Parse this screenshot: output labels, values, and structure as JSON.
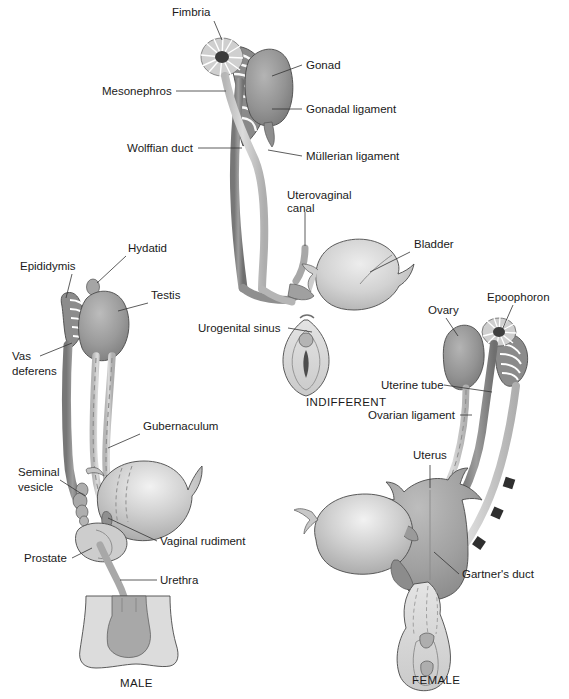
{
  "figure": {
    "background_color": "#ffffff",
    "width": 569,
    "height": 699
  },
  "palette": {
    "gonad_dark": "#8d8d8d",
    "gonad_mid": "#9a9a9a",
    "duct_gray": "#8a8a8a",
    "duct_light": "#c9c9c9",
    "organ_light": "#d3d3d3",
    "organ_pale": "#dedede",
    "uterus_gray": "#a5a5a5",
    "outline": "#4a4a4a",
    "text": "#1a1a1a",
    "leader": "#333333"
  },
  "panels": [
    {
      "id": "indifferent",
      "caption": "INDIFFERENT",
      "caption_pos": {
        "x": 306,
        "y": 406
      },
      "labels": [
        {
          "name": "fimbria",
          "text": "Fimbria",
          "x": 172,
          "y": 16,
          "anchor": "start",
          "leader": [
            [
              214,
              21
            ],
            [
              222,
              40
            ]
          ]
        },
        {
          "name": "gonad",
          "text": "Gonad",
          "x": 306,
          "y": 69,
          "anchor": "start",
          "leader": [
            [
              302,
              65
            ],
            [
              272,
              76
            ]
          ]
        },
        {
          "name": "mesonephros",
          "text": "Mesonephros",
          "x": 102,
          "y": 95,
          "anchor": "start",
          "leader": [
            [
              176,
              91
            ],
            [
              226,
              91
            ]
          ]
        },
        {
          "name": "gonadal-ligament",
          "text": "Gonadal ligament",
          "x": 306,
          "y": 113,
          "anchor": "start",
          "leader": [
            [
              302,
              109
            ],
            [
              272,
              109
            ]
          ]
        },
        {
          "name": "wolffian-duct",
          "text": "Wolffian duct",
          "x": 127,
          "y": 152,
          "anchor": "start",
          "leader": [
            [
              198,
              148
            ],
            [
              242,
              148
            ]
          ]
        },
        {
          "name": "mullerian-ligament",
          "text": "Müllerian ligament",
          "x": 306,
          "y": 160,
          "anchor": "start",
          "leader": [
            [
              302,
              156
            ],
            [
              268,
              150
            ]
          ]
        },
        {
          "name": "uterovaginal-canal-line1",
          "text": "Uterovaginal",
          "x": 287,
          "y": 199,
          "anchor": "start",
          "leader": [
            [
              305,
              212
            ],
            [
              305,
              246
            ]
          ]
        },
        {
          "name": "uterovaginal-canal-line2",
          "text": "canal",
          "x": 287,
          "y": 212,
          "anchor": "start",
          "leader": null
        },
        {
          "name": "bladder",
          "text": "Bladder",
          "x": 414,
          "y": 248,
          "anchor": "start",
          "leader": [
            [
              410,
              252
            ],
            [
              370,
              272
            ]
          ]
        },
        {
          "name": "urogenital-sinus",
          "text": "Urogenital sinus",
          "x": 198,
          "y": 332,
          "anchor": "start",
          "leader": [
            [
              288,
              328
            ],
            [
              312,
              332
            ]
          ]
        }
      ]
    },
    {
      "id": "male",
      "caption": "MALE",
      "caption_pos": {
        "x": 120,
        "y": 687
      },
      "labels": [
        {
          "name": "hydatid",
          "text": "Hydatid",
          "x": 128,
          "y": 252,
          "anchor": "start",
          "leader": [
            [
              126,
              256
            ],
            [
              97,
              283
            ]
          ]
        },
        {
          "name": "epididymis",
          "text": "Epididymis",
          "x": 20,
          "y": 270,
          "anchor": "start",
          "leader": [
            [
              72,
              274
            ],
            [
              66,
              298
            ]
          ]
        },
        {
          "name": "testis",
          "text": "Testis",
          "x": 151,
          "y": 299,
          "anchor": "start",
          "leader": [
            [
              148,
              303
            ],
            [
              118,
              311
            ]
          ]
        },
        {
          "name": "vas-deferens-line1",
          "text": "Vas",
          "x": 12,
          "y": 360,
          "anchor": "start",
          "leader": [
            [
              40,
              356
            ],
            [
              72,
              343
            ]
          ]
        },
        {
          "name": "vas-deferens-line2",
          "text": "deferens",
          "x": 12,
          "y": 375,
          "anchor": "start",
          "leader": null
        },
        {
          "name": "gubernaculum",
          "text": "Gubernaculum",
          "x": 143,
          "y": 430,
          "anchor": "start",
          "leader": [
            [
              140,
              434
            ],
            [
              108,
              448
            ]
          ]
        },
        {
          "name": "seminal-vesicle-line1",
          "text": "Seminal",
          "x": 18,
          "y": 476,
          "anchor": "start",
          "leader": [
            [
              60,
              480
            ],
            [
              85,
              496
            ]
          ]
        },
        {
          "name": "seminal-vesicle-line2",
          "text": "vesicle",
          "x": 18,
          "y": 491,
          "anchor": "start",
          "leader": null
        },
        {
          "name": "vaginal-rudiment",
          "text": "Vaginal rudiment",
          "x": 160,
          "y": 545,
          "anchor": "start",
          "leader": [
            [
              157,
              541
            ],
            [
              108,
              518
            ]
          ]
        },
        {
          "name": "prostate",
          "text": "Prostate",
          "x": 24,
          "y": 562,
          "anchor": "start",
          "leader": [
            [
              72,
              558
            ],
            [
              92,
              548
            ]
          ]
        },
        {
          "name": "urethra",
          "text": "Urethra",
          "x": 160,
          "y": 584,
          "anchor": "start",
          "leader": [
            [
              157,
              580
            ],
            [
              120,
              580
            ]
          ]
        }
      ]
    },
    {
      "id": "female",
      "caption": "FEMALE",
      "caption_pos": {
        "x": 412,
        "y": 684
      },
      "labels": [
        {
          "name": "ovary",
          "text": "Ovary",
          "x": 428,
          "y": 314,
          "anchor": "start",
          "leader": [
            [
              446,
              318
            ],
            [
              458,
              336
            ]
          ]
        },
        {
          "name": "epoophoron",
          "text": "Epoophoron",
          "x": 487,
          "y": 301,
          "anchor": "start",
          "leader": [
            [
              513,
              305
            ],
            [
              502,
              330
            ]
          ]
        },
        {
          "name": "uterine-tube",
          "text": "Uterine tube",
          "x": 381,
          "y": 389,
          "anchor": "start",
          "leader": [
            [
              444,
              385
            ],
            [
              492,
              392
            ]
          ]
        },
        {
          "name": "ovarian-ligament",
          "text": "Ovarian ligament",
          "x": 368,
          "y": 419,
          "anchor": "start",
          "leader": [
            [
              460,
              415
            ],
            [
              472,
              415
            ]
          ]
        },
        {
          "name": "uterus",
          "text": "Uterus",
          "x": 413,
          "y": 459,
          "anchor": "start",
          "leader": [
            [
              430,
              465
            ],
            [
              430,
              488
            ]
          ]
        },
        {
          "name": "gartners-duct",
          "text": "Gartner's duct",
          "x": 462,
          "y": 578,
          "anchor": "start",
          "leader": [
            [
              459,
              574
            ],
            [
              434,
              552
            ]
          ]
        }
      ]
    }
  ]
}
